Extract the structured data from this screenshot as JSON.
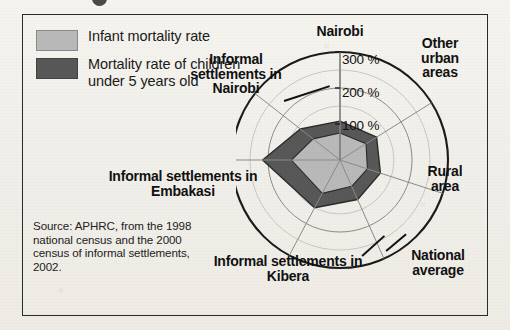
{
  "figure": {
    "background_color": "#f3f1ec",
    "border_color": "#2a2a2a"
  },
  "legend": {
    "items": [
      {
        "label": "Infant mortality rate",
        "color": "#b9b9b9",
        "swatch_name": "legend-swatch-infant"
      },
      {
        "label": "Mortality rate of children under 5 years old",
        "color": "#585858",
        "swatch_name": "legend-swatch-under5"
      }
    ]
  },
  "source_note": "Source: APHRC, from the 1998 national census and the 2000 census of informal settlements, 2002.",
  "axis_labels": {
    "nairobi": "Nairobi",
    "other_urban": "Other urban areas",
    "rural": "Rural area",
    "national": "National average",
    "kibera": "Informal settlements in Kibera",
    "embakasi": "Informal settlements in Embakasi",
    "informal_nairobi": "Informal settlements in Nairobi"
  },
  "tick_labels": [
    "100 %",
    "200 %",
    "300 %"
  ],
  "chart_data": {
    "type": "radar",
    "title": "",
    "xlabel": "",
    "ylabel": "",
    "categories": [
      "Nairobi",
      "Other urban areas",
      "Rural area",
      "National average",
      "Informal settlements in Kibera",
      "Informal settlements in Embakasi",
      "Informal settlements in Nairobi"
    ],
    "rings": [
      100,
      200,
      300
    ],
    "rlim": [
      0,
      300
    ],
    "runit": "%",
    "grid": true,
    "legend_position": "top-left",
    "series": [
      {
        "name": "Infant mortality rate",
        "color": "#b9b9b9",
        "values": [
          75,
          85,
          80,
          80,
          105,
          135,
          95
        ]
      },
      {
        "name": "Mortality rate of children under 5 years old",
        "color": "#585858",
        "values": [
          108,
          120,
          118,
          120,
          150,
          215,
          140
        ]
      }
    ]
  }
}
